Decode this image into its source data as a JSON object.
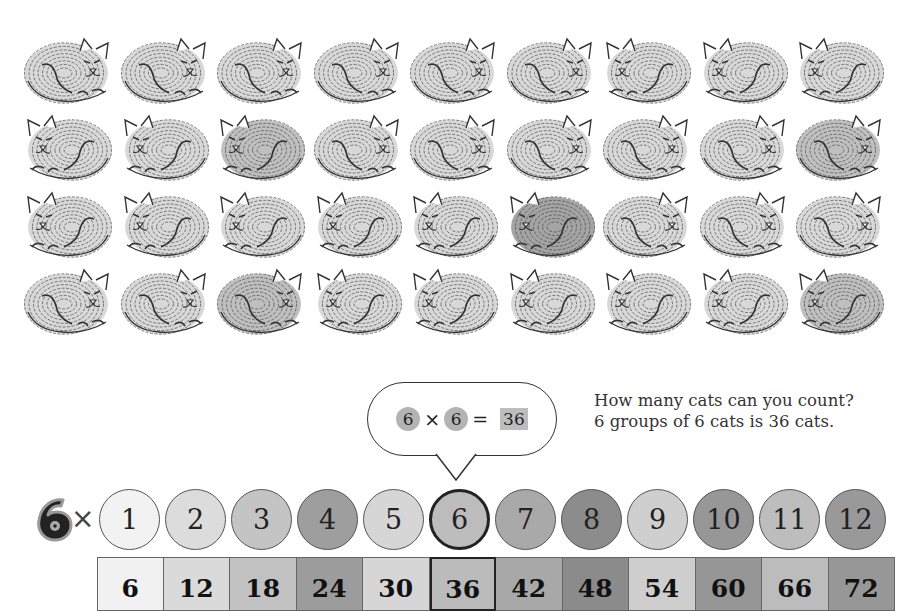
{
  "illustration": {
    "description": "4 rows x 9 sleeping fingerprint-style cats",
    "rows": [
      {
        "cats": [
          {
            "facing": "right",
            "shade": "light"
          },
          {
            "facing": "right",
            "shade": "light"
          },
          {
            "facing": "right",
            "shade": "light"
          },
          {
            "facing": "right",
            "shade": "light"
          },
          {
            "facing": "right",
            "shade": "light"
          },
          {
            "facing": "right",
            "shade": "light"
          },
          {
            "facing": "left",
            "shade": "light"
          },
          {
            "facing": "left",
            "shade": "light"
          },
          {
            "facing": "left",
            "shade": "light"
          }
        ]
      },
      {
        "cats": [
          {
            "facing": "left",
            "shade": "light"
          },
          {
            "facing": "left",
            "shade": "light"
          },
          {
            "facing": "left",
            "shade": "medium"
          },
          {
            "facing": "right",
            "shade": "light"
          },
          {
            "facing": "right",
            "shade": "light"
          },
          {
            "facing": "right",
            "shade": "light"
          },
          {
            "facing": "right",
            "shade": "light"
          },
          {
            "facing": "right",
            "shade": "light"
          },
          {
            "facing": "right",
            "shade": "medium"
          }
        ]
      },
      {
        "cats": [
          {
            "facing": "left",
            "shade": "light"
          },
          {
            "facing": "left",
            "shade": "light"
          },
          {
            "facing": "left",
            "shade": "light"
          },
          {
            "facing": "left",
            "shade": "light"
          },
          {
            "facing": "left",
            "shade": "light"
          },
          {
            "facing": "left",
            "shade": "dark"
          },
          {
            "facing": "right",
            "shade": "light"
          },
          {
            "facing": "right",
            "shade": "light"
          },
          {
            "facing": "right",
            "shade": "light"
          }
        ]
      },
      {
        "cats": [
          {
            "facing": "right",
            "shade": "light"
          },
          {
            "facing": "right",
            "shade": "light"
          },
          {
            "facing": "right",
            "shade": "medium"
          },
          {
            "facing": "left",
            "shade": "light"
          },
          {
            "facing": "left",
            "shade": "light"
          },
          {
            "facing": "left",
            "shade": "light"
          },
          {
            "facing": "left",
            "shade": "light"
          },
          {
            "facing": "left",
            "shade": "light"
          },
          {
            "facing": "left",
            "shade": "medium"
          }
        ]
      }
    ]
  },
  "bubble": {
    "factor_a": "6",
    "times": "×",
    "factor_b": "6",
    "equals": "=",
    "product": "36"
  },
  "question": {
    "line1": "How many cats can you count?",
    "line2": "6 groups of 6 cats is 36 cats."
  },
  "table": {
    "multiplier": "6",
    "times": "×",
    "selected_index": 5,
    "factors": [
      {
        "label": "1",
        "color": "#f2f2f2"
      },
      {
        "label": "2",
        "color": "#dcdcdc"
      },
      {
        "label": "3",
        "color": "#c4c4c4"
      },
      {
        "label": "4",
        "color": "#9e9e9e"
      },
      {
        "label": "5",
        "color": "#d6d6d6"
      },
      {
        "label": "6",
        "color": "#bcbcbc"
      },
      {
        "label": "7",
        "color": "#a9a9a9"
      },
      {
        "label": "8",
        "color": "#8c8c8c"
      },
      {
        "label": "9",
        "color": "#cfcfcf"
      },
      {
        "label": "10",
        "color": "#979797"
      },
      {
        "label": "11",
        "color": "#bdbdbd"
      },
      {
        "label": "12",
        "color": "#999999"
      }
    ],
    "products": [
      {
        "label": "6",
        "color": "#f1f1f1"
      },
      {
        "label": "12",
        "color": "#dadada"
      },
      {
        "label": "18",
        "color": "#c2c2c2"
      },
      {
        "label": "24",
        "color": "#9c9c9c"
      },
      {
        "label": "30",
        "color": "#d6d6d6"
      },
      {
        "label": "36",
        "color": "#bbbbbb"
      },
      {
        "label": "42",
        "color": "#a8a8a8"
      },
      {
        "label": "48",
        "color": "#8b8b8b"
      },
      {
        "label": "54",
        "color": "#cecece"
      },
      {
        "label": "60",
        "color": "#969696"
      },
      {
        "label": "66",
        "color": "#bcbcbc"
      },
      {
        "label": "72",
        "color": "#979797"
      }
    ]
  }
}
